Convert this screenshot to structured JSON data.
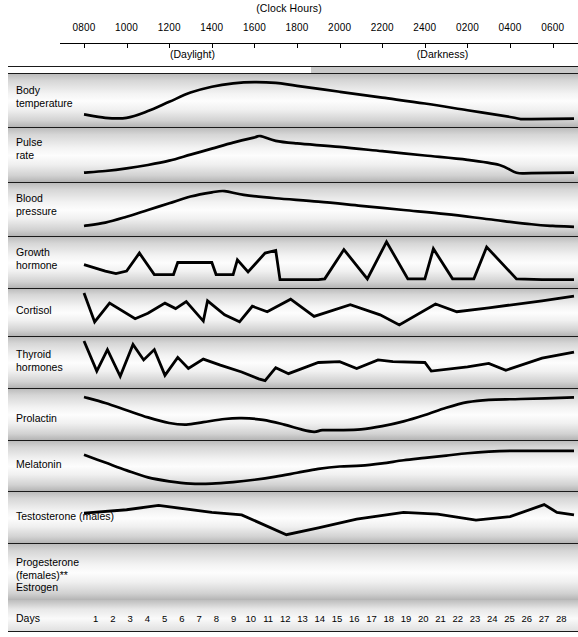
{
  "header": {
    "clock_title": "(Clock Hours)",
    "daylight_label": "(Daylight)",
    "darkness_label": "(Darkness)",
    "hour_ticks": [
      "0800",
      "1000",
      "1200",
      "1400",
      "1600",
      "1800",
      "2000",
      "2200",
      "2400",
      "0200",
      "0400",
      "0600"
    ]
  },
  "axis": {
    "days_label": "Days",
    "day_numbers": [
      1,
      2,
      3,
      4,
      5,
      6,
      7,
      8,
      9,
      10,
      11,
      12,
      13,
      14,
      15,
      16,
      17,
      18,
      19,
      20,
      21,
      22,
      23,
      24,
      25,
      26,
      27,
      28
    ]
  },
  "rows": [
    {
      "label": "Body\ntemperature"
    },
    {
      "label": "Pulse\nrate"
    },
    {
      "label": "Blood\npressure"
    },
    {
      "label": "Growth\nhormone"
    },
    {
      "label": "Cortisol"
    },
    {
      "label": "Thyroid\nhormones"
    },
    {
      "label": "Prolactin"
    },
    {
      "label": "Melatonin"
    },
    {
      "label": "Testosterone (males)"
    },
    {
      "label": "Progesterone\n(females)**"
    },
    {
      "label": "Estrogen"
    }
  ],
  "colors": {
    "curve": "#000000",
    "darkness_band": "#c9c9c9",
    "row_line": "#1a1a1a",
    "background": "#ffffff"
  },
  "chart_data": {
    "type": "line",
    "title": "(Clock Hours)",
    "xlabel": "Clock Hours",
    "ylabel": "",
    "grid": false,
    "legend_position": "none",
    "x_axis": {
      "tick_labels": [
        "0800",
        "1000",
        "1200",
        "1400",
        "1600",
        "1800",
        "2000",
        "2200",
        "2400",
        "0200",
        "0400",
        "0600"
      ],
      "range_hours": [
        8,
        31
      ],
      "daylight_span": [
        "0800",
        "1900"
      ],
      "darkness_span": [
        "1900",
        "0700"
      ]
    },
    "secondary_axis": {
      "label": "Days",
      "tick_labels": [
        1,
        2,
        3,
        4,
        5,
        6,
        7,
        8,
        9,
        10,
        11,
        12,
        13,
        14,
        15,
        16,
        17,
        18,
        19,
        20,
        21,
        22,
        23,
        24,
        25,
        26,
        27,
        28
      ],
      "applies_to": [
        "Progesterone (females)**",
        "Estrogen"
      ]
    },
    "series": [
      {
        "name": "Body temperature",
        "peak_hour": "1600",
        "trough_hour": "0400",
        "points": [
          [
            8,
            0.18
          ],
          [
            9,
            0.1
          ],
          [
            10,
            0.1
          ],
          [
            11,
            0.26
          ],
          [
            12,
            0.48
          ],
          [
            13,
            0.7
          ],
          [
            14,
            0.84
          ],
          [
            15,
            0.92
          ],
          [
            16,
            0.95
          ],
          [
            17,
            0.93
          ],
          [
            18,
            0.86
          ],
          [
            20,
            0.72
          ],
          [
            22,
            0.58
          ],
          [
            24,
            0.44
          ],
          [
            26,
            0.28
          ],
          [
            28,
            0.12
          ],
          [
            28.5,
            0.07
          ],
          [
            29,
            0.07
          ],
          [
            31,
            0.08
          ]
        ]
      },
      {
        "name": "Pulse rate",
        "peak_hour": "1600",
        "trough_hour": "0400",
        "points": [
          [
            8,
            0.1
          ],
          [
            9,
            0.14
          ],
          [
            10,
            0.2
          ],
          [
            11,
            0.28
          ],
          [
            12,
            0.38
          ],
          [
            13,
            0.52
          ],
          [
            14,
            0.66
          ],
          [
            15,
            0.8
          ],
          [
            16,
            0.92
          ],
          [
            16.3,
            0.95
          ],
          [
            17,
            0.84
          ],
          [
            18,
            0.78
          ],
          [
            20,
            0.7
          ],
          [
            22,
            0.6
          ],
          [
            24,
            0.5
          ],
          [
            26,
            0.4
          ],
          [
            27.5,
            0.28
          ],
          [
            28.3,
            0.1
          ],
          [
            29,
            0.09
          ],
          [
            31,
            0.1
          ]
        ]
      },
      {
        "name": "Blood pressure",
        "peak_hour": "1500",
        "trough_hour": "0600",
        "points": [
          [
            8,
            0.12
          ],
          [
            9,
            0.2
          ],
          [
            10,
            0.34
          ],
          [
            11,
            0.5
          ],
          [
            12,
            0.66
          ],
          [
            13,
            0.82
          ],
          [
            14,
            0.92
          ],
          [
            14.6,
            0.95
          ],
          [
            15.5,
            0.86
          ],
          [
            17,
            0.78
          ],
          [
            19,
            0.7
          ],
          [
            21,
            0.6
          ],
          [
            23,
            0.5
          ],
          [
            25,
            0.4
          ],
          [
            27,
            0.28
          ],
          [
            29,
            0.16
          ],
          [
            30,
            0.12
          ],
          [
            31,
            0.1
          ]
        ]
      },
      {
        "name": "Growth hormone",
        "pattern": "pulsatile",
        "largest_peak_hour": "2230",
        "points": [
          [
            8,
            0.45
          ],
          [
            9,
            0.3
          ],
          [
            9.5,
            0.24
          ],
          [
            10,
            0.3
          ],
          [
            10.6,
            0.72
          ],
          [
            11.3,
            0.22
          ],
          [
            12.2,
            0.22
          ],
          [
            12.4,
            0.5
          ],
          [
            14,
            0.5
          ],
          [
            14.2,
            0.22
          ],
          [
            15,
            0.22
          ],
          [
            15.2,
            0.56
          ],
          [
            15.7,
            0.28
          ],
          [
            16.5,
            0.72
          ],
          [
            17,
            0.78
          ],
          [
            17.2,
            0.1
          ],
          [
            19,
            0.1
          ],
          [
            19.3,
            0.12
          ],
          [
            20.2,
            0.8
          ],
          [
            21.3,
            0.12
          ],
          [
            22.2,
            0.98
          ],
          [
            23.2,
            0.12
          ],
          [
            24,
            0.12
          ],
          [
            24.4,
            0.82
          ],
          [
            25.3,
            0.12
          ],
          [
            26.3,
            0.12
          ],
          [
            26.9,
            0.86
          ],
          [
            28.3,
            0.12
          ],
          [
            29.5,
            0.1
          ],
          [
            31,
            0.1
          ]
        ]
      },
      {
        "name": "Cortisol",
        "pattern": "pulsatile",
        "peak_hour": "0800",
        "points": [
          [
            8,
            1.0
          ],
          [
            8.5,
            0.26
          ],
          [
            9.2,
            0.74
          ],
          [
            10.4,
            0.34
          ],
          [
            11,
            0.48
          ],
          [
            11.8,
            0.74
          ],
          [
            12.3,
            0.6
          ],
          [
            12.8,
            0.78
          ],
          [
            13.6,
            0.28
          ],
          [
            13.8,
            0.8
          ],
          [
            14.6,
            0.44
          ],
          [
            15.3,
            0.26
          ],
          [
            15.9,
            0.66
          ],
          [
            16.6,
            0.52
          ],
          [
            17.7,
            0.84
          ],
          [
            18.8,
            0.4
          ],
          [
            20.5,
            0.7
          ],
          [
            21.9,
            0.44
          ],
          [
            22.8,
            0.18
          ],
          [
            24.5,
            0.72
          ],
          [
            25.5,
            0.52
          ],
          [
            27,
            0.62
          ],
          [
            29.5,
            0.8
          ],
          [
            31,
            0.92
          ]
        ]
      },
      {
        "name": "Thyroid hormones",
        "pattern": "pulsatile",
        "trough_hour": "1700",
        "points": [
          [
            8,
            1.0
          ],
          [
            8.6,
            0.3
          ],
          [
            9.1,
            0.8
          ],
          [
            9.7,
            0.18
          ],
          [
            10.3,
            0.92
          ],
          [
            10.8,
            0.56
          ],
          [
            11.3,
            0.8
          ],
          [
            11.8,
            0.2
          ],
          [
            12.4,
            0.62
          ],
          [
            12.9,
            0.36
          ],
          [
            13.6,
            0.58
          ],
          [
            14.4,
            0.44
          ],
          [
            15.4,
            0.28
          ],
          [
            16.2,
            0.12
          ],
          [
            16.5,
            0.08
          ],
          [
            17,
            0.38
          ],
          [
            17.6,
            0.24
          ],
          [
            19,
            0.5
          ],
          [
            20,
            0.52
          ],
          [
            20.8,
            0.36
          ],
          [
            21.8,
            0.56
          ],
          [
            22.5,
            0.52
          ],
          [
            24,
            0.5
          ],
          [
            24.3,
            0.3
          ],
          [
            26,
            0.4
          ],
          [
            27,
            0.48
          ],
          [
            27.8,
            0.32
          ],
          [
            29.5,
            0.6
          ],
          [
            31,
            0.74
          ]
        ]
      },
      {
        "name": "Prolactin",
        "trough_hour": "1900",
        "peak_hour": "0500",
        "points": [
          [
            8,
            0.95
          ],
          [
            9,
            0.8
          ],
          [
            10,
            0.62
          ],
          [
            11,
            0.44
          ],
          [
            12,
            0.3
          ],
          [
            12.8,
            0.26
          ],
          [
            13.6,
            0.32
          ],
          [
            14.6,
            0.4
          ],
          [
            15.4,
            0.42
          ],
          [
            16.4,
            0.38
          ],
          [
            17.4,
            0.26
          ],
          [
            18.2,
            0.14
          ],
          [
            18.8,
            0.08
          ],
          [
            19.2,
            0.12
          ],
          [
            20,
            0.12
          ],
          [
            21,
            0.14
          ],
          [
            22,
            0.22
          ],
          [
            23,
            0.34
          ],
          [
            24,
            0.5
          ],
          [
            25,
            0.68
          ],
          [
            26,
            0.82
          ],
          [
            27,
            0.88
          ],
          [
            28.5,
            0.9
          ],
          [
            31,
            0.94
          ]
        ]
      },
      {
        "name": "Melatonin",
        "trough_hour": "1300",
        "peak_hour": "0400",
        "points": [
          [
            8,
            0.8
          ],
          [
            9,
            0.6
          ],
          [
            10,
            0.4
          ],
          [
            11,
            0.22
          ],
          [
            12,
            0.12
          ],
          [
            13,
            0.06
          ],
          [
            14,
            0.06
          ],
          [
            15,
            0.1
          ],
          [
            16,
            0.16
          ],
          [
            17,
            0.24
          ],
          [
            18,
            0.34
          ],
          [
            19,
            0.44
          ],
          [
            20,
            0.5
          ],
          [
            21,
            0.52
          ],
          [
            22,
            0.58
          ],
          [
            23,
            0.66
          ],
          [
            24,
            0.72
          ],
          [
            25,
            0.78
          ],
          [
            26,
            0.84
          ],
          [
            27,
            0.88
          ],
          [
            28,
            0.9
          ],
          [
            29,
            0.9
          ],
          [
            31,
            0.9
          ]
        ]
      },
      {
        "name": "Testosterone (males)",
        "trough_hour": "1900",
        "peak_hour": "0600",
        "points": [
          [
            8,
            0.6
          ],
          [
            10,
            0.68
          ],
          [
            11.5,
            0.78
          ],
          [
            14,
            0.62
          ],
          [
            15.4,
            0.56
          ],
          [
            17.5,
            0.1
          ],
          [
            19,
            0.26
          ],
          [
            20.8,
            0.46
          ],
          [
            23,
            0.62
          ],
          [
            24.6,
            0.58
          ],
          [
            26.4,
            0.44
          ],
          [
            28,
            0.52
          ],
          [
            29.6,
            0.8
          ],
          [
            30.2,
            0.62
          ],
          [
            31,
            0.56
          ]
        ]
      },
      {
        "name": "Progesterone (females)**",
        "cycle": "28-day",
        "peak_day": 22,
        "points": [
          [
            1,
            0.3
          ],
          [
            2,
            0.28
          ],
          [
            6,
            0.28
          ],
          [
            11,
            0.28
          ],
          [
            14,
            0.28
          ],
          [
            15,
            0.32
          ],
          [
            16,
            0.5
          ],
          [
            17,
            0.66
          ],
          [
            19,
            0.8
          ],
          [
            21,
            0.86
          ],
          [
            22,
            0.88
          ],
          [
            24,
            0.86
          ],
          [
            25,
            0.8
          ],
          [
            26,
            0.62
          ],
          [
            27,
            0.44
          ],
          [
            28,
            0.36
          ]
        ]
      },
      {
        "name": "Estrogen",
        "cycle": "28-day",
        "peaks_days": [
          13,
          22
        ],
        "points": [
          [
            1,
            0.34
          ],
          [
            2,
            0.26
          ],
          [
            4,
            0.24
          ],
          [
            6,
            0.26
          ],
          [
            8,
            0.34
          ],
          [
            10,
            0.5
          ],
          [
            12,
            0.62
          ],
          [
            13,
            0.64
          ],
          [
            14,
            0.58
          ],
          [
            15,
            0.44
          ],
          [
            16,
            0.28
          ],
          [
            17,
            0.2
          ],
          [
            18,
            0.18
          ],
          [
            19,
            0.24
          ],
          [
            20,
            0.38
          ],
          [
            21,
            0.48
          ],
          [
            22,
            0.5
          ],
          [
            23,
            0.48
          ],
          [
            24,
            0.44
          ],
          [
            25,
            0.34
          ],
          [
            26,
            0.22
          ],
          [
            27,
            0.14
          ],
          [
            28,
            0.1
          ]
        ]
      }
    ]
  }
}
